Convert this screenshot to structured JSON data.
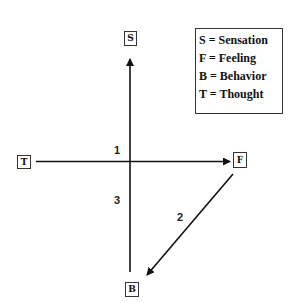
{
  "diagram": {
    "nodes": {
      "S": "S",
      "F": "F",
      "B": "B",
      "T": "T"
    },
    "legend": [
      "S = Sensation",
      "F = Feeling",
      "B = Behavior",
      "T = Thought"
    ],
    "edge_labels": {
      "one": "1",
      "two": "2",
      "three": "3"
    },
    "edges": [
      {
        "from": "T",
        "to": "F",
        "label": "1",
        "arrow": "F"
      },
      {
        "from": "F",
        "to": "B",
        "label": "2",
        "arrow": "B"
      },
      {
        "from": "B",
        "to": "S",
        "label": "3",
        "arrow": "S"
      }
    ],
    "colors": {
      "line": "#111111",
      "background": "#ffffff"
    }
  }
}
